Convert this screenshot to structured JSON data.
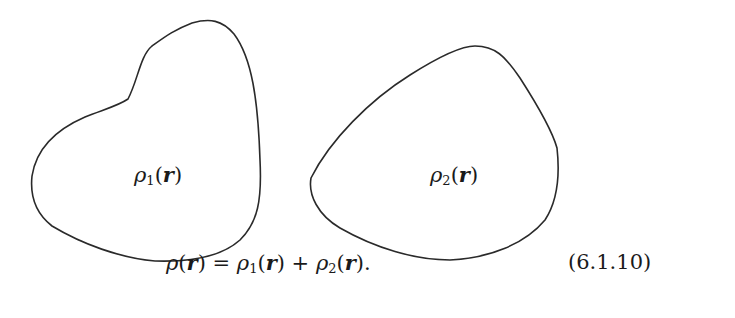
{
  "figure": {
    "regions": [
      {
        "name": "region-1",
        "symbol": "ρ",
        "subscript": "1",
        "arg": "r",
        "label": "ρ1(r)"
      },
      {
        "name": "region-2",
        "symbol": "ρ",
        "subscript": "2",
        "arg": "r",
        "label": "ρ2(r)"
      }
    ],
    "stroke_color": "#2a2a2a"
  },
  "equation": {
    "lhs": "ρ(r)",
    "text": "ρ(r) = ρ1(r) + ρ2(r).",
    "parts": {
      "rho": "ρ",
      "r": "r",
      "sub1": "1",
      "sub2": "2",
      "eq": "=",
      "plus": "+",
      "period": "."
    },
    "number": "(6.1.10)"
  }
}
